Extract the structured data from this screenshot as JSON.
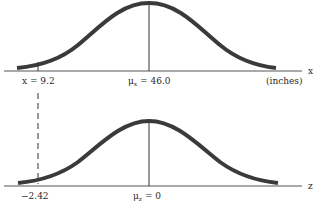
{
  "top_panel": {
    "axis_label": "x",
    "unit_label": "(inches)",
    "mean_label_prefix": "μ",
    "mean_subscript": "x",
    "mean_label_value": " = 46.0",
    "marker_label": "x = 9.2",
    "mean": 46.0,
    "marker_value": 9.2
  },
  "bottom_panel": {
    "axis_label": "z",
    "mean_label_prefix": "μ",
    "mean_subscript": "z",
    "mean_label_value": " = 0",
    "marker_label": "−2.42",
    "mean": 0,
    "marker_value": -2.42
  },
  "colors": {
    "curve": "#3a3a3a",
    "axis": "#555555",
    "text": "#2a2a2a"
  }
}
